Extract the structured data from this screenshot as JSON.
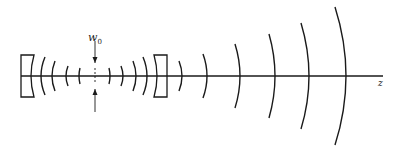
{
  "diagram": {
    "labels": {
      "waist_symbol": "w",
      "waist_subscript": "0",
      "axis_label": "z"
    },
    "colors": {
      "stroke": "#1a1a1a",
      "background": "#ffffff"
    },
    "axis": {
      "y": 76,
      "x_start": 21,
      "x_end": 383
    },
    "waist": {
      "x": 95,
      "arrow_top": [
        41,
        63
      ],
      "arrow_bottom": [
        89,
        112
      ]
    },
    "mirrors": [
      {
        "name": "left-mirror",
        "x_outer": 21,
        "x_face": 34,
        "y_top": 55,
        "y_bottom": 97,
        "sag": 3
      },
      {
        "name": "right-mirror",
        "x_outer": 167,
        "x_face": 154,
        "y_top": 55,
        "y_bottom": 97,
        "sag": 3
      }
    ],
    "wavefronts": [
      {
        "x": 41,
        "half": 19,
        "sag": 4,
        "dir": -1
      },
      {
        "x": 52,
        "half": 15,
        "sag": 3,
        "dir": -1
      },
      {
        "x": 66,
        "half": 10,
        "sag": 2,
        "dir": -1
      },
      {
        "x": 79,
        "half": 8,
        "sag": 1,
        "dir": -1
      },
      {
        "x": 110,
        "half": 8,
        "sag": 1,
        "dir": 1
      },
      {
        "x": 123,
        "half": 10,
        "sag": 2,
        "dir": 1
      },
      {
        "x": 136,
        "half": 15,
        "sag": 3,
        "dir": 1
      },
      {
        "x": 147,
        "half": 19,
        "sag": 4,
        "dir": 1
      },
      {
        "x": 182,
        "half": 15,
        "sag": 3,
        "dir": 1
      },
      {
        "x": 207,
        "half": 22,
        "sag": 4,
        "dir": 1
      },
      {
        "x": 240,
        "half": 32,
        "sag": 5,
        "dir": 1
      },
      {
        "x": 275,
        "half": 42,
        "sag": 6,
        "dir": 1
      },
      {
        "x": 309,
        "half": 53,
        "sag": 8,
        "dir": 1
      },
      {
        "x": 346,
        "half": 69,
        "sag": 11,
        "dir": 1
      }
    ]
  }
}
